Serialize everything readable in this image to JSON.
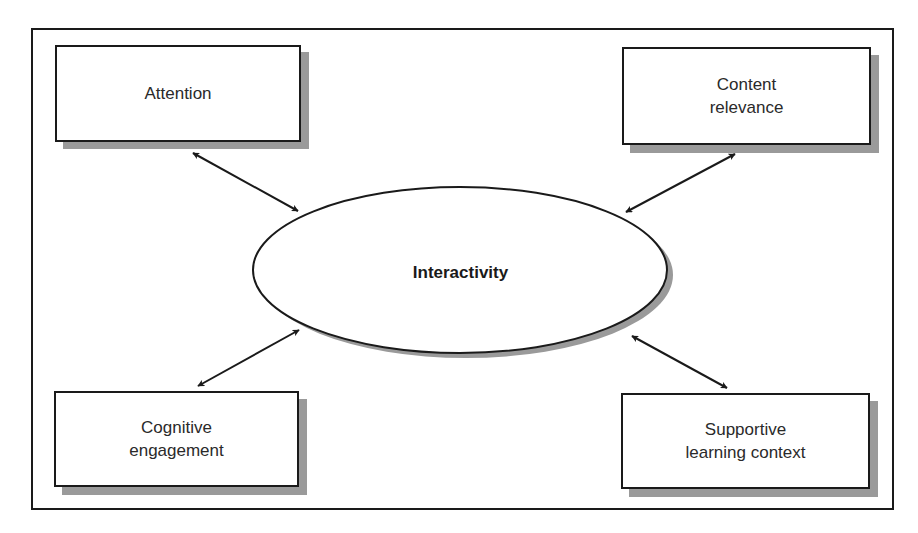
{
  "diagram": {
    "center": {
      "label": "Interactivity"
    },
    "nodes": [
      {
        "id": "attention",
        "lines": [
          "Attention"
        ]
      },
      {
        "id": "content-relevance",
        "lines": [
          "Content",
          "relevance"
        ]
      },
      {
        "id": "cognitive-engagement",
        "lines": [
          "Cognitive",
          "engagement"
        ]
      },
      {
        "id": "supportive-learning-context",
        "lines": [
          "Supportive",
          "learning context"
        ]
      }
    ],
    "edges": [
      {
        "from": "attention",
        "to": "Interactivity",
        "type": "bidirectional"
      },
      {
        "from": "content-relevance",
        "to": "Interactivity",
        "type": "bidirectional"
      },
      {
        "from": "cognitive-engagement",
        "to": "Interactivity",
        "type": "bidirectional"
      },
      {
        "from": "supportive-learning-context",
        "to": "Interactivity",
        "type": "bidirectional"
      }
    ],
    "colors": {
      "stroke": "#1a1a1a",
      "shadow": "#9a9a9a",
      "fill": "#ffffff",
      "text": "#2a2a2a"
    }
  }
}
